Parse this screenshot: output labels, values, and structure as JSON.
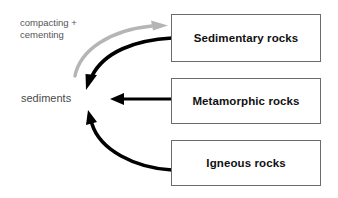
{
  "diagram": {
    "background_color": "#ffffff",
    "nodes": {
      "sediments": {
        "label": "sediments",
        "type": "plain-text-node",
        "color": "#4a4a4a"
      },
      "sedimentary": {
        "label": "Sedimentary rocks",
        "type": "box",
        "border_color": "#6b6b6b",
        "text_color": "#111111"
      },
      "metamorphic": {
        "label": "Metamorphic rocks",
        "type": "box",
        "border_color": "#6b6b6b",
        "text_color": "#111111"
      },
      "igneous": {
        "label": "Igneous rocks",
        "type": "box",
        "border_color": "#6b6b6b",
        "text_color": "#111111"
      }
    },
    "annotations": [
      {
        "id": "compacting-cementing",
        "line1": "compacting +",
        "line2": "cementing",
        "color": "#555555"
      }
    ],
    "edges": [
      {
        "id": "sediments-to-sedimentary",
        "from": "sediments",
        "to": "sedimentary",
        "style": "curved",
        "color": "#b0b0b0",
        "label": "compacting + cementing"
      },
      {
        "id": "sedimentary-to-sediments",
        "from": "sedimentary",
        "to": "sediments",
        "style": "curved",
        "color": "#000000",
        "label": ""
      },
      {
        "id": "metamorphic-to-sediments",
        "from": "metamorphic",
        "to": "sediments",
        "style": "straight",
        "color": "#000000",
        "label": ""
      },
      {
        "id": "igneous-to-sediments",
        "from": "igneous",
        "to": "sediments",
        "style": "curved",
        "color": "#000000",
        "label": ""
      }
    ]
  }
}
